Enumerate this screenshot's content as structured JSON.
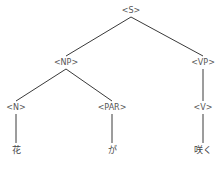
{
  "tree": {
    "root": "S",
    "nodes": [
      {
        "id": "S",
        "label": "<S>",
        "type": "phrase"
      },
      {
        "id": "NP",
        "label": "<NP>",
        "type": "phrase"
      },
      {
        "id": "VP",
        "label": "<VP>",
        "type": "phrase"
      },
      {
        "id": "N",
        "label": "<N>",
        "type": "pos"
      },
      {
        "id": "PAR",
        "label": "<PAR>",
        "type": "pos"
      },
      {
        "id": "V",
        "label": "<V>",
        "type": "pos"
      },
      {
        "id": "w1",
        "label": "花",
        "type": "word"
      },
      {
        "id": "w2",
        "label": "が",
        "type": "word"
      },
      {
        "id": "w3",
        "label": "咲く",
        "type": "word"
      }
    ],
    "edges": [
      [
        "S",
        "NP"
      ],
      [
        "S",
        "VP"
      ],
      [
        "NP",
        "N"
      ],
      [
        "NP",
        "PAR"
      ],
      [
        "VP",
        "V"
      ],
      [
        "N",
        "w1"
      ],
      [
        "PAR",
        "w2"
      ],
      [
        "V",
        "w3"
      ]
    ]
  }
}
